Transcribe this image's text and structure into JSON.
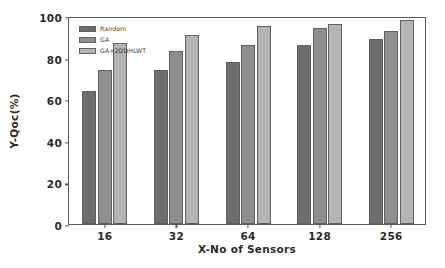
{
  "chart_data": {
    "type": "bar",
    "title": "",
    "xlabel": "X-No of Sensors",
    "ylabel": "Y-Qoc(%)",
    "categories": [
      "16",
      "32",
      "64",
      "128",
      "256"
    ],
    "series": [
      {
        "name": "Random",
        "color": "#6e6e6e",
        "values": [
          64,
          74,
          78,
          86,
          89
        ]
      },
      {
        "name": "GA",
        "color": "#8f8f8f",
        "values": [
          74,
          83,
          86,
          94,
          93
        ]
      },
      {
        "name": "GA+2DDHLWT",
        "color": "#b4b4b4",
        "values": [
          87,
          91,
          95,
          96,
          98
        ]
      }
    ],
    "ylim": [
      0,
      100
    ],
    "yticks": [
      0,
      20,
      40,
      60,
      80,
      100
    ],
    "ytick_labels": [
      "0",
      "20",
      "40",
      "60",
      "80",
      "100"
    ],
    "grid": false,
    "legend_position": "upper left",
    "axis_color": "#5a5a5a",
    "background": "#ffffff"
  }
}
